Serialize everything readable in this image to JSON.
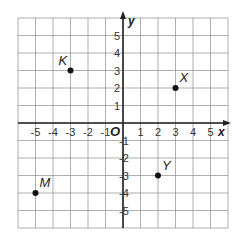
{
  "figure": {
    "type": "coordinate-plane",
    "x_axis_label": "x",
    "y_axis_label": "y",
    "origin_label": "O",
    "x_range": [
      -6,
      6
    ],
    "y_range": [
      -6,
      6
    ],
    "x_ticks": [
      "-5",
      "-4",
      "-3",
      "-2",
      "-1",
      "1",
      "2",
      "3",
      "4",
      "5"
    ],
    "y_ticks": [
      "5",
      "4",
      "3",
      "2",
      "1",
      "-1",
      "-2",
      "-3",
      "-4",
      "-5"
    ],
    "grid": true,
    "colors": {
      "grid": "#9a9a9a",
      "axes": "#222222",
      "points": "#111111"
    }
  },
  "points": [
    {
      "label": "K",
      "x": -3,
      "y": 3
    },
    {
      "label": "X",
      "x": 3,
      "y": 2
    },
    {
      "label": "M",
      "x": -5,
      "y": -4
    },
    {
      "label": "Y",
      "x": 2,
      "y": -3
    }
  ]
}
